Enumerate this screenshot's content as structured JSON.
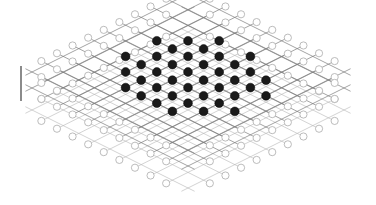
{
  "figure": {
    "title": "Isometric lattice diagram",
    "background_color": "#ffffff",
    "width": 376,
    "height": 205
  },
  "style": {
    "filled_node_color": "#1a1a1a",
    "filled_node_stroke": "#000000",
    "open_node_fill": "#ffffff",
    "open_node_stroke": "#b0b0b0",
    "lattice_line_color": "#7d7d7d",
    "lattice_line_color_light": "#b5b5b5",
    "scale_bar_color": "#6e6e6e",
    "node_radius": 4.4,
    "open_node_radius": 3.6,
    "line_width": 0.7
  },
  "scale_bar": {
    "name": "scale-bar",
    "x": 21,
    "y_top": 66,
    "y_bottom": 101,
    "thickness": 1.6,
    "label": ""
  },
  "chart_data": {
    "type": "scatter",
    "title": "Isometric lattice diagram",
    "xlabel": "",
    "ylabel": "",
    "projection": "isometric",
    "grid": true,
    "legend": [
      {
        "marker": "filled-circle",
        "label": "occupied site",
        "color": "#1a1a1a"
      },
      {
        "marker": "open-circle",
        "label": "vacant / boundary site",
        "color": "#b0b0b0"
      }
    ],
    "lattice": {
      "origin_x": 188,
      "origin_y": 100,
      "u_step": [
        15.6,
        7.8
      ],
      "v_step": [
        -15.6,
        7.8
      ],
      "layer_offset_y": 11.0,
      "layers": 3,
      "cols": 9,
      "rows": 9
    },
    "layers": [
      {
        "index": 0,
        "name": "top-layer",
        "y_shift": -28,
        "occupied": [
          [
            2,
            0
          ],
          [
            4,
            0
          ],
          [
            1,
            1
          ],
          [
            3,
            1
          ],
          [
            5,
            1
          ],
          [
            0,
            2
          ],
          [
            2,
            2
          ],
          [
            4,
            2
          ],
          [
            6,
            2
          ],
          [
            1,
            3
          ],
          [
            3,
            3
          ],
          [
            5,
            3
          ],
          [
            0,
            4
          ],
          [
            2,
            4
          ],
          [
            4,
            4
          ],
          [
            6,
            4
          ],
          [
            1,
            5
          ],
          [
            3,
            5
          ],
          [
            5,
            5
          ],
          [
            2,
            6
          ],
          [
            4,
            6
          ]
        ]
      },
      {
        "index": 1,
        "name": "middle-layer",
        "y_shift": -12,
        "occupied": [
          [
            1,
            0
          ],
          [
            3,
            0
          ],
          [
            5,
            0
          ],
          [
            0,
            1
          ],
          [
            2,
            1
          ],
          [
            4,
            1
          ],
          [
            6,
            1
          ],
          [
            1,
            2
          ],
          [
            3,
            2
          ],
          [
            5,
            2
          ],
          [
            0,
            3
          ],
          [
            2,
            3
          ],
          [
            4,
            3
          ],
          [
            6,
            3
          ],
          [
            1,
            4
          ],
          [
            3,
            4
          ],
          [
            5,
            4
          ],
          [
            2,
            5
          ],
          [
            4,
            5
          ]
        ]
      },
      {
        "index": 2,
        "name": "bottom-layer",
        "y_shift": 10,
        "occupied": []
      }
    ],
    "open_nodes_count": 48,
    "filled_nodes_count": 40
  }
}
